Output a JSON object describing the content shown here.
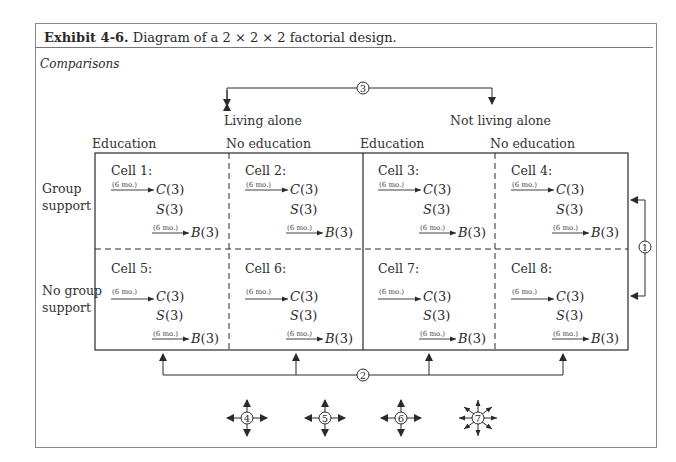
{
  "exhibit": {
    "label": "Exhibit 4-6.",
    "caption": "Diagram of a 2 × 2 × 2 factorial design."
  },
  "section_label": "Comparisons",
  "factors": {
    "living": [
      "Living alone",
      "Not living alone"
    ],
    "education": [
      "Education",
      "No education",
      "Education",
      "No education"
    ],
    "support": [
      "Group support",
      "No group support"
    ],
    "support_lines": [
      [
        "Group",
        "support"
      ],
      [
        "No group",
        "support"
      ]
    ]
  },
  "cells": [
    {
      "title": "Cell 1:",
      "interval1": "(6 mo.)",
      "c": "C",
      "c_n": "(3)",
      "s": "S",
      "s_n": "(3)",
      "interval2": "(6 mo.)",
      "b": "B",
      "b_n": "(3)"
    },
    {
      "title": "Cell 2:",
      "interval1": "(6 mo.)",
      "c": "C",
      "c_n": "(3)",
      "s": "S",
      "s_n": "(3)",
      "interval2": "(6 mo.)",
      "b": "B",
      "b_n": "(3)"
    },
    {
      "title": "Cell 3:",
      "interval1": "(6 mo.)",
      "c": "C",
      "c_n": "(3)",
      "s": "S",
      "s_n": "(3)",
      "interval2": "(6 mo.)",
      "b": "B",
      "b_n": "(3)"
    },
    {
      "title": "Cell 4:",
      "interval1": "(6 mo.)",
      "c": "C",
      "c_n": "(3)",
      "s": "S",
      "s_n": "(3)",
      "interval2": "(6 mo.)",
      "b": "B",
      "b_n": "(3)"
    },
    {
      "title": "Cell 5:",
      "interval1": "(6 mo.)",
      "c": "C",
      "c_n": "(3)",
      "s": "S",
      "s_n": "(3)",
      "interval2": "(6 mo.)",
      "b": "B",
      "b_n": "(3)"
    },
    {
      "title": "Cell 6:",
      "interval1": "(6 mo.)",
      "c": "C",
      "c_n": "(3)",
      "s": "S",
      "s_n": "(3)",
      "interval2": "(6 mo.)",
      "b": "B",
      "b_n": "(3)"
    },
    {
      "title": "Cell 7:",
      "interval1": "(6 mo.)",
      "c": "C",
      "c_n": "(3)",
      "s": "S",
      "s_n": "(3)",
      "interval2": "(6 mo.)",
      "b": "B",
      "b_n": "(3)"
    },
    {
      "title": "Cell 8:",
      "interval1": "(6 mo.)",
      "c": "C",
      "c_n": "(3)",
      "s": "S",
      "s_n": "(3)",
      "interval2": "(6 mo.)",
      "b": "B",
      "b_n": "(3)"
    }
  ],
  "comparisons": [
    {
      "id": "1",
      "description": "Group support vs. no group support"
    },
    {
      "id": "2",
      "description": "Education vs. no education"
    },
    {
      "id": "3",
      "description": "Living alone vs. not living alone"
    },
    {
      "id": "4",
      "arrows": 4
    },
    {
      "id": "5",
      "arrows": 4
    },
    {
      "id": "6",
      "arrows": 4
    },
    {
      "id": "7",
      "arrows": 8
    }
  ],
  "colors": {
    "line": "#2a2a2a",
    "frame": "#8a8a8a",
    "text": "#2a2a2a"
  }
}
